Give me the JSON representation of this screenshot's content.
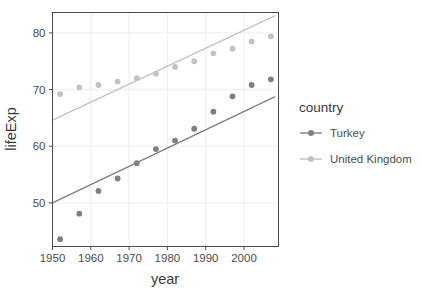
{
  "chart_data": {
    "type": "scatter",
    "title": "",
    "subtitle": "",
    "xlabel": "year",
    "ylabel": "lifeExp",
    "xlim": [
      1950,
      2009
    ],
    "ylim": [
      42.3,
      83.6
    ],
    "xticks": [
      1950,
      1960,
      1970,
      1980,
      1990,
      2000
    ],
    "yticks": [
      50,
      60,
      70,
      80
    ],
    "xtick_labels": [
      "1950",
      "1960",
      "1970",
      "1980",
      "1990",
      "2000"
    ],
    "ytick_labels": [
      "50",
      "60",
      "70",
      "80"
    ],
    "grid": true,
    "grid_color": "#f2f2f2",
    "panel_background": "#ffffff",
    "panel_border_color": "#4d4d4d",
    "legend_position": "right",
    "legend_title": "country",
    "x": [
      1952,
      1957,
      1962,
      1967,
      1972,
      1977,
      1982,
      1987,
      1992,
      1997,
      2002,
      2007
    ],
    "series": [
      {
        "name": "Turkey",
        "color": "#7f7f7f",
        "values": [
          43.6,
          48.1,
          52.1,
          54.3,
          57.0,
          59.5,
          61.0,
          63.1,
          66.1,
          68.8,
          70.8,
          71.8
        ],
        "trend_line": {
          "x0": 1950,
          "y0": 50.0,
          "x1": 2008,
          "y1": 68.7
        }
      },
      {
        "name": "United Kingdom",
        "color": "#c2c2c2",
        "values": [
          69.2,
          70.4,
          70.8,
          71.4,
          72.0,
          72.8,
          74.0,
          75.0,
          76.4,
          77.2,
          78.5,
          79.4
        ],
        "trend_line": {
          "x0": 1950,
          "y0": 64.6,
          "x1": 2008,
          "y1": 83.0
        }
      }
    ]
  },
  "axes": {
    "x_title": "year",
    "y_title": "lifeExp"
  },
  "legend": {
    "title": "country",
    "entries": [
      {
        "label": "Turkey",
        "color": "#7f7f7f"
      },
      {
        "label": "United Kingdom",
        "color": "#c2c2c2"
      }
    ]
  }
}
